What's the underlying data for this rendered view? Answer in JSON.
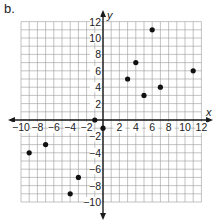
{
  "part_label": "b.",
  "chart_data": {
    "type": "scatter",
    "title": "",
    "xlabel": "x",
    "ylabel": "y",
    "xlim": [
      -10,
      12
    ],
    "ylim": [
      -10,
      12
    ],
    "grid": true,
    "x_ticks": [
      -10,
      -8,
      -6,
      -4,
      -2,
      2,
      4,
      6,
      8,
      10,
      12
    ],
    "y_ticks": [
      12,
      10,
      8,
      6,
      4,
      2,
      -2,
      -4,
      -6,
      -8,
      -10
    ],
    "points": [
      {
        "x": 6,
        "y": 11
      },
      {
        "x": 4,
        "y": 7
      },
      {
        "x": 3,
        "y": 5
      },
      {
        "x": 11,
        "y": 6
      },
      {
        "x": 7,
        "y": 4
      },
      {
        "x": 5,
        "y": 3
      },
      {
        "x": -1,
        "y": 0
      },
      {
        "x": 0,
        "y": -1
      },
      {
        "x": -7,
        "y": -3
      },
      {
        "x": -9,
        "y": -4
      },
      {
        "x": -3,
        "y": -7
      },
      {
        "x": -4,
        "y": -9
      }
    ],
    "colors": {
      "grid": "#9a9a9a",
      "axis": "#1a1a1a",
      "point": "#111111"
    }
  }
}
